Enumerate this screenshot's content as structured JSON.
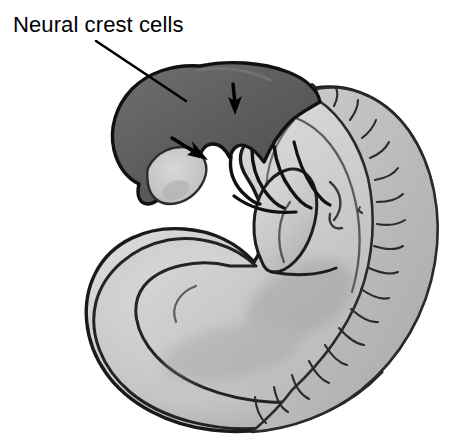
{
  "figure": {
    "type": "anatomical-illustration",
    "background_color": "#ffffff",
    "width": 460,
    "height": 447
  },
  "annotations": {
    "label": {
      "text": "Neural crest cells",
      "color": "#000000",
      "x": 13,
      "y": 12,
      "font_size": 22
    },
    "leader_line": {
      "name": "label-leader-line",
      "from_x": 96,
      "from_y": 41,
      "to_x": 186,
      "to_y": 101,
      "color": "#000000"
    },
    "arrows": [
      {
        "name": "arrow-down-neural-crest",
        "direction": "down",
        "tip_x": 235,
        "tip_y": 113,
        "tail_x": 233,
        "tail_y": 84,
        "color": "#000000"
      },
      {
        "name": "arrow-diagonal-neural-crest",
        "direction": "down-right",
        "tip_x": 206,
        "tip_y": 159,
        "tail_x": 173,
        "tail_y": 139,
        "color": "#000000"
      }
    ]
  },
  "regions": {
    "head": {
      "name": "head-neural-crest-region",
      "description": "Darkly shaded cranial region containing migrating neural crest cells",
      "fill_color": "#5d5d5d",
      "fill_color_light": "#727272",
      "outline_color": "#111111"
    },
    "body": {
      "name": "embryo-trunk",
      "description": "Light gray C-shaped embryonic trunk and tail",
      "fill_color": "#c9c9c9",
      "fill_color_light": "#dedede",
      "fill_color_shadow": "#a9a9a9",
      "outline_color": "#1a1a1a"
    },
    "somites": {
      "name": "somite-block-series",
      "description": "Segmented somite blocks along the dorsal margin",
      "count": 22,
      "fill_color": "#bdbdbd",
      "outline_color": "#2a2a2a"
    },
    "pharyngeal_arches": {
      "name": "pharyngeal-arch-series",
      "description": "Pharyngeal (branchial) arches below the head",
      "count": 4,
      "outline_color": "#111111"
    },
    "optic_vesicle": {
      "name": "optic-vesicle",
      "description": "Pale oval vesicle within the dark head region",
      "fill_color": "#cfcfcf"
    },
    "limb_bud": {
      "name": "limb-bud",
      "description": "Rounded forelimb bud on the ventral body wall",
      "fill_color": "#c4c4c4"
    },
    "heart_bulge": {
      "name": "heart-bulge",
      "description": "Ventral cardiac prominence",
      "fill_color": "#bfbfbf"
    }
  }
}
